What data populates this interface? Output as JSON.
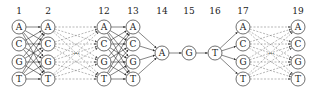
{
  "columns": [
    {
      "label": "1",
      "x": 19,
      "nodes": [
        "A",
        "C",
        "G",
        "T"
      ]
    },
    {
      "label": "2",
      "x": 48,
      "nodes": [
        "A",
        "C",
        "G",
        "T"
      ]
    },
    {
      "label": "12",
      "x": 104,
      "nodes": [
        "A",
        "C",
        "G",
        "T"
      ]
    },
    {
      "label": "13",
      "x": 133,
      "nodes": [
        "A",
        "C",
        "G",
        "T"
      ]
    },
    {
      "label": "14",
      "x": 162,
      "nodes": [
        "A"
      ]
    },
    {
      "label": "15",
      "x": 189,
      "nodes": [
        "G"
      ]
    },
    {
      "label": "16",
      "x": 215,
      "nodes": [
        "T"
      ]
    },
    {
      "label": "17",
      "x": 243,
      "nodes": [
        "A",
        "C",
        "G",
        "T"
      ]
    },
    {
      "label": "19",
      "x": 298,
      "nodes": [
        "A",
        "C",
        "G",
        "T"
      ]
    }
  ],
  "rows_y": [
    27,
    44,
    62,
    79
  ],
  "single_y": 53,
  "label_y": 14,
  "node_radius": 7,
  "colors": {
    "stroke": "#333333",
    "dashed": "#888888",
    "text": "#222222"
  },
  "connections": [
    {
      "from": 0,
      "to": 1,
      "type": "full"
    },
    {
      "from": 1,
      "to": 2,
      "type": "dashed"
    },
    {
      "from": 2,
      "to": 3,
      "type": "full"
    },
    {
      "from": 3,
      "to": 4,
      "type": "converge"
    },
    {
      "from": 4,
      "to": 5,
      "type": "single"
    },
    {
      "from": 5,
      "to": 6,
      "type": "single"
    },
    {
      "from": 6,
      "to": 7,
      "type": "diverge"
    },
    {
      "from": 7,
      "to": 8,
      "type": "dashed"
    }
  ]
}
